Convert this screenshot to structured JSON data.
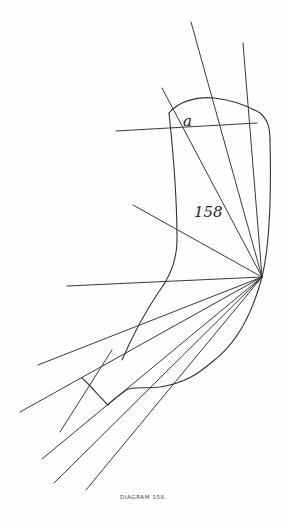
{
  "figure": {
    "caption": "DIAGRAM 158.",
    "labels": {
      "region_label": "a",
      "figure_number": "158"
    },
    "colors": {
      "ink": "#333333",
      "paper": "#fefefe"
    },
    "focal_point": [
      262,
      277
    ]
  }
}
